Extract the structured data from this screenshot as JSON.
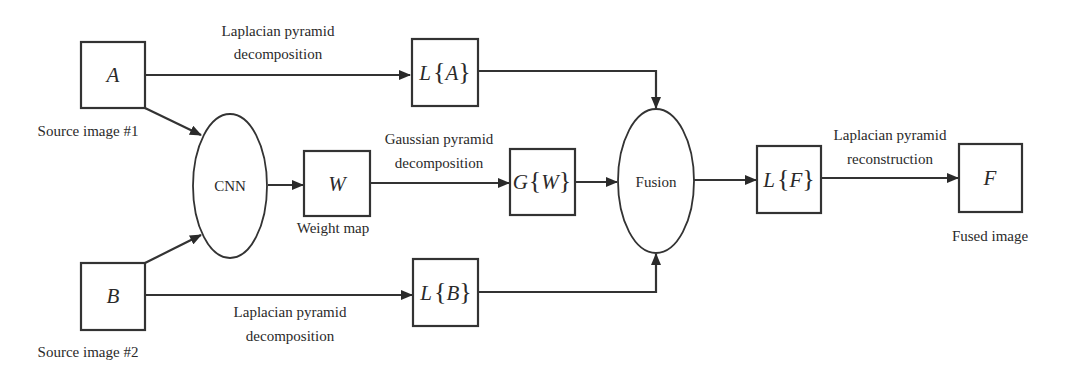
{
  "diagram": {
    "nodes": {
      "source_a": {
        "symbol": "A",
        "caption": "Source image #1"
      },
      "source_b": {
        "symbol": "B",
        "caption": "Source image #2"
      },
      "cnn": {
        "label": "CNN"
      },
      "weight": {
        "symbol": "W",
        "caption": "Weight map"
      },
      "la": {
        "op": "L",
        "open": "{",
        "arg": "A",
        "close": "}"
      },
      "lb": {
        "op": "L",
        "open": "{",
        "arg": "B",
        "close": "}"
      },
      "gw": {
        "op": "G",
        "open": "{",
        "arg": "W",
        "close": "}"
      },
      "fusion": {
        "label": "Fusion"
      },
      "lf": {
        "op": "L",
        "open": "{",
        "arg": "F",
        "close": "}"
      },
      "fused": {
        "symbol": "F",
        "caption": "Fused image"
      }
    },
    "edge_labels": {
      "a_to_la": {
        "line1": "Laplacian pyramid",
        "line2": "decomposition"
      },
      "b_to_lb": {
        "line1": "Laplacian pyramid",
        "line2": "decomposition"
      },
      "w_to_gw": {
        "line1": "Gaussian pyramid",
        "line2": "decomposition"
      },
      "lf_to_f": {
        "line1": "Laplacian pyramid",
        "line2": "reconstruction"
      }
    },
    "edges": [
      [
        "source_a",
        "la"
      ],
      [
        "source_a",
        "cnn"
      ],
      [
        "source_b",
        "cnn"
      ],
      [
        "source_b",
        "lb"
      ],
      [
        "cnn",
        "weight"
      ],
      [
        "weight",
        "gw"
      ],
      [
        "la",
        "fusion"
      ],
      [
        "gw",
        "fusion"
      ],
      [
        "lb",
        "fusion"
      ],
      [
        "fusion",
        "lf"
      ],
      [
        "lf",
        "fused"
      ]
    ]
  }
}
